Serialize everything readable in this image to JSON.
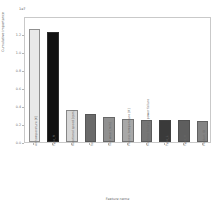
{
  "chart_data": {
    "type": "bar",
    "title": "",
    "subtitle": "",
    "xlabel": "Feature name",
    "ylabel": "Cumulative importance",
    "y_offset_label": "1e7",
    "grid": false,
    "legend": null,
    "ylim": [
      0,
      1.4
    ],
    "ytick_labels": [
      "0.0",
      "0.2",
      "0.4",
      "0.6",
      "0.8",
      "1.0",
      "1.2"
    ],
    "ytick_values": [
      0.0,
      0.2,
      0.4,
      0.6,
      0.8,
      1.0,
      1.2
    ],
    "categories": [
      "Air temperature [K]",
      "Type_M",
      "Rotational speed [rpm]",
      "Torque [Nm]",
      "Tool wear [min]",
      "Process temperature [K]",
      "Machine failure / power failure",
      "Type_L",
      "Type_H",
      "Product ID"
    ],
    "values": [
      1.26,
      1.22,
      0.36,
      0.31,
      0.28,
      0.26,
      0.25,
      0.24,
      0.24,
      0.23
    ],
    "bar_colors": [
      "#e8e8e8",
      "#111111",
      "#d6d6d6",
      "#6a6a6a",
      "#909090",
      "#a8a8a8",
      "#767676",
      "#3a3a3a",
      "#5e5e5e",
      "#848484"
    ]
  }
}
